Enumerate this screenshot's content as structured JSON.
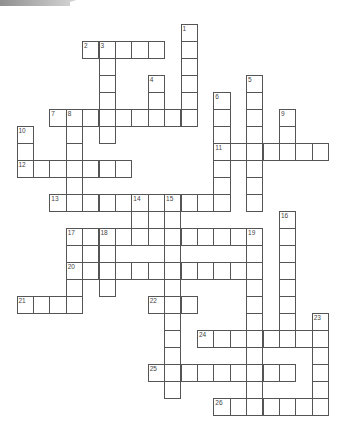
{
  "puzzle": {
    "type": "crossword",
    "grid": {
      "origin_x": 17,
      "origin_y": 24,
      "cell_w": 16.4,
      "cell_h": 17
    },
    "words": [
      {
        "num": "1",
        "dir": "down",
        "row": 0,
        "col": 10,
        "len": 6
      },
      {
        "num": "2",
        "dir": "across",
        "row": 1,
        "col": 4,
        "len": 5
      },
      {
        "num": "3",
        "dir": "down",
        "row": 1,
        "col": 5,
        "len": 6
      },
      {
        "num": "4",
        "dir": "down",
        "row": 3,
        "col": 8,
        "len": 3
      },
      {
        "num": "5",
        "dir": "down",
        "row": 3,
        "col": 14,
        "len": 8
      },
      {
        "num": "6",
        "dir": "down",
        "row": 4,
        "col": 12,
        "len": 7
      },
      {
        "num": "7",
        "dir": "across",
        "row": 5,
        "col": 2,
        "len": 9
      },
      {
        "num": "8",
        "dir": "down",
        "row": 5,
        "col": 3,
        "len": 6
      },
      {
        "num": "9",
        "dir": "down",
        "row": 5,
        "col": 16,
        "len": 3
      },
      {
        "num": "10",
        "dir": "down",
        "row": 6,
        "col": 0,
        "len": 3
      },
      {
        "num": "11",
        "dir": "across",
        "row": 7,
        "col": 12,
        "len": 7
      },
      {
        "num": "12",
        "dir": "across",
        "row": 8,
        "col": 0,
        "len": 7
      },
      {
        "num": "13",
        "dir": "across",
        "row": 10,
        "col": 2,
        "len": 11
      },
      {
        "num": "14",
        "dir": "down",
        "row": 10,
        "col": 7,
        "len": 3
      },
      {
        "num": "15",
        "dir": "down",
        "row": 10,
        "col": 9,
        "len": 12
      },
      {
        "num": "16",
        "dir": "down",
        "row": 11,
        "col": 16,
        "len": 8
      },
      {
        "num": "17",
        "dir": "across",
        "row": 12,
        "col": 3,
        "len": 12
      },
      {
        "num": "18",
        "dir": "down",
        "row": 12,
        "col": 5,
        "len": 4
      },
      {
        "num": "19",
        "dir": "down",
        "row": 12,
        "col": 14,
        "len": 11
      },
      {
        "num": "20",
        "dir": "across",
        "row": 14,
        "col": 3,
        "len": 12
      },
      {
        "num": "21",
        "dir": "across",
        "row": 16,
        "col": 0,
        "len": 4
      },
      {
        "num": "22",
        "dir": "across",
        "row": 16,
        "col": 8,
        "len": 3
      },
      {
        "num": "23",
        "dir": "down",
        "row": 17,
        "col": 18,
        "len": 6
      },
      {
        "num": "24",
        "dir": "across",
        "row": 18,
        "col": 11,
        "len": 8
      },
      {
        "num": "25",
        "dir": "across",
        "row": 20,
        "col": 8,
        "len": 9
      },
      {
        "num": "26",
        "dir": "across",
        "row": 22,
        "col": 12,
        "len": 7
      }
    ],
    "extra_cells": [
      [
        11,
        8
      ],
      [
        13,
        3
      ],
      [
        13,
        4
      ],
      [
        15,
        3
      ],
      [
        16,
        3
      ]
    ]
  }
}
